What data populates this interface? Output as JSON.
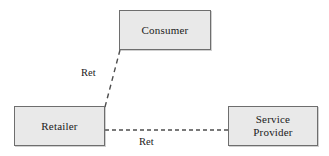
{
  "diagram": {
    "canvas": {
      "width": 329,
      "height": 156,
      "background_color": "#ffffff"
    },
    "style": {
      "node_fill": "#e9e9e9",
      "node_border": "#6e6e6e",
      "edge_color": "#4d4d4d",
      "text_color": "#1a1a1a"
    },
    "nodes": [
      {
        "id": "consumer",
        "label": "Consumer",
        "x": 119,
        "y": 10,
        "width": 92,
        "height": 40
      },
      {
        "id": "retailer",
        "label": "Retailer",
        "x": 14,
        "y": 106,
        "width": 91,
        "height": 40
      },
      {
        "id": "service-provider",
        "label": "Service\nProvider",
        "x": 228,
        "y": 106,
        "width": 90,
        "height": 40
      }
    ],
    "edges": [
      {
        "id": "retailer-consumer",
        "source": "retailer",
        "target": "consumer",
        "label": "Ret",
        "style": "dashed",
        "x1": 105,
        "y1": 107,
        "x2": 120,
        "y2": 50,
        "label_x": 81,
        "label_y": 67
      },
      {
        "id": "retailer-service-provider",
        "source": "retailer",
        "target": "service-provider",
        "label": "Ret",
        "style": "dashed",
        "x1": 105,
        "y1": 130,
        "x2": 228,
        "y2": 130,
        "label_x": 139,
        "label_y": 136
      }
    ]
  }
}
